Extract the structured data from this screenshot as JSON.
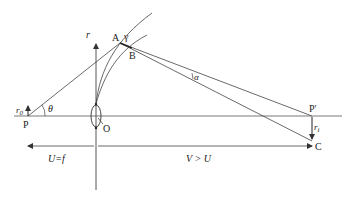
{
  "diagram": {
    "colors": {
      "stroke": "#333333",
      "background": "#ffffff"
    },
    "labels": {
      "r_axis": "r",
      "A": "A",
      "B": "B",
      "gamma": "γ",
      "alpha": "α",
      "theta": "θ",
      "r0_base": "r",
      "r0_sub": "0",
      "P": "P",
      "O": "O",
      "P_prime": "P′",
      "ri_base": "r",
      "ri_sub": "i",
      "C": "C",
      "U_eq_f": "U=f",
      "V_gt_U": "V > U"
    }
  }
}
